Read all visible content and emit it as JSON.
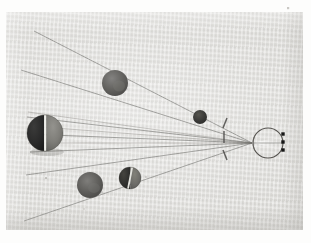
{
  "figure": {
    "medium": "monochrome photographic print on gray card",
    "plate_background": "#d9d8d4",
    "page_background": "#fdfdfc",
    "photo_region": {
      "x": 6,
      "y": 12,
      "width": 297,
      "height": 218
    },
    "ray_color": "#6d6c68",
    "ink_color": "#151515"
  },
  "chart_data": {
    "type": "diagram",
    "xlabel": "",
    "ylabel": "",
    "grid": false,
    "legend": null,
    "objects": [
      {
        "name": "large-sphere-terminator",
        "role": "nearest large sphere with visible terminator",
        "cx": 45,
        "cy": 133,
        "r": 18,
        "shading": "dark-left-light-right",
        "dark_color": "#2a2a2a",
        "light_color": "#7e7d78",
        "terminator_color": "#efefea"
      },
      {
        "name": "upper-gray-sphere",
        "role": "mid-distance sphere, upper ray path",
        "cx": 115,
        "cy": 83,
        "r": 13,
        "shading": "uniform-gray",
        "dark_color": "#5d5c57",
        "light_color": "#777672",
        "terminator_color": null
      },
      {
        "name": "small-dark-sphere",
        "role": "far sphere near convergence axis",
        "cx": 200,
        "cy": 117,
        "r": 7,
        "shading": "uniform-dark",
        "dark_color": "#3a3a38",
        "light_color": "#4d4c49",
        "terminator_color": null
      },
      {
        "name": "lower-gray-sphere",
        "role": "mid-distance sphere, lower ray path",
        "cx": 90,
        "cy": 185,
        "r": 13,
        "shading": "uniform-gray",
        "dark_color": "#5a5955",
        "light_color": "#747370",
        "terminator_color": null
      },
      {
        "name": "lower-dark-sphere-terminator",
        "role": "sphere with diagonal terminator, lower path",
        "cx": 130,
        "cy": 178,
        "r": 11,
        "shading": "dark-with-diagonal-terminator",
        "dark_color": "#2f2f2d",
        "light_color": "#6e6d69",
        "terminator_color": "#e3e3de"
      }
    ],
    "eye": {
      "name": "schematic-eye",
      "cx": 268,
      "cy": 143,
      "r": 15,
      "lens_cusp_x": 253,
      "retina_dots": [
        {
          "x": 283,
          "y": 134
        },
        {
          "x": 283,
          "y": 142
        },
        {
          "x": 283,
          "y": 150
        }
      ],
      "dot_size": 3.4
    },
    "aperture_ticks": [
      {
        "name": "upper-tick",
        "x1": 227,
        "y1": 118,
        "x2": 223,
        "y2": 128
      },
      {
        "name": "center-tick",
        "x1": 224,
        "y1": 131,
        "x2": 224,
        "y2": 143
      },
      {
        "name": "lower-tick",
        "x1": 223,
        "y1": 150,
        "x2": 227,
        "y2": 160
      }
    ],
    "convergence_point": {
      "x": 252,
      "y": 143
    },
    "rays": [
      {
        "name": "ray-far-upper-left",
        "x1": 34,
        "y1": 31,
        "x2": 252,
        "y2": 143
      },
      {
        "name": "ray-upper-left",
        "x1": 21,
        "y1": 70,
        "x2": 252,
        "y2": 143
      },
      {
        "name": "ray-upper-sphere-top",
        "x1": 28,
        "y1": 112,
        "x2": 252,
        "y2": 143
      },
      {
        "name": "ray-large-sphere-top",
        "x1": 27,
        "y1": 117,
        "x2": 252,
        "y2": 143
      },
      {
        "name": "ray-large-sphere-upper-mid",
        "x1": 29,
        "y1": 126,
        "x2": 252,
        "y2": 143
      },
      {
        "name": "ray-large-sphere-axis",
        "x1": 27,
        "y1": 134,
        "x2": 252,
        "y2": 143
      },
      {
        "name": "ray-large-sphere-lower-mid",
        "x1": 28,
        "y1": 143,
        "x2": 252,
        "y2": 143
      },
      {
        "name": "ray-large-sphere-bottom",
        "x1": 30,
        "y1": 152,
        "x2": 252,
        "y2": 143
      },
      {
        "name": "ray-lower-sphere-path",
        "x1": 26,
        "y1": 175,
        "x2": 252,
        "y2": 143
      },
      {
        "name": "ray-far-lower-left",
        "x1": 24,
        "y1": 221,
        "x2": 252,
        "y2": 143
      }
    ],
    "notes": [
      "Ray bundles converge from the left-hand spheres to a point just left of the eye.",
      "Three short stroke marks stand between the converging rays and the eye.",
      "Three filled black squares sit on the right side of the eye circle."
    ]
  }
}
